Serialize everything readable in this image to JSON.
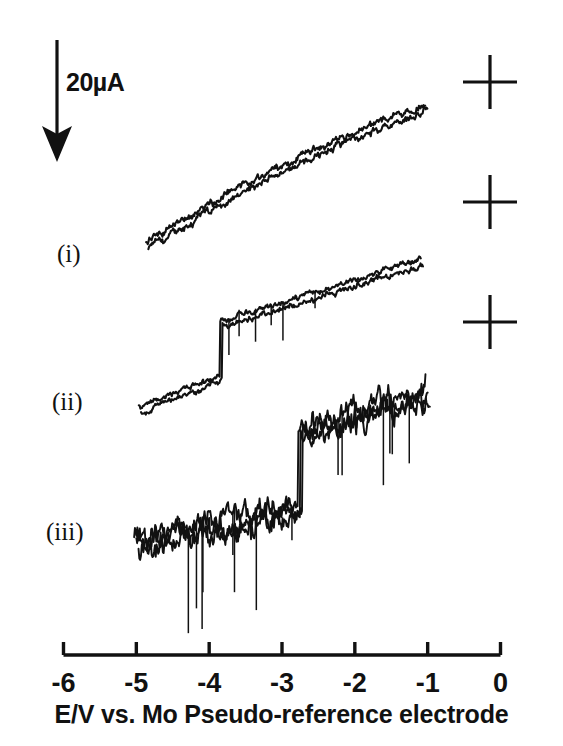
{
  "figure": {
    "background_color": "#ffffff",
    "ink_color": "#111111"
  },
  "scale_bar": {
    "label": "20µA",
    "direction": "down",
    "icon": "down-arrow-icon"
  },
  "trace_labels": {
    "i": "(i)",
    "ii": "(ii)",
    "iii": "(iii)"
  },
  "axis": {
    "title": "E/V vs. Mo Pseudo-reference electrode",
    "tick_labels": [
      "-6",
      "-5",
      "-4",
      "-3",
      "-2",
      "-1",
      "0"
    ],
    "tick_values": [
      -6,
      -5,
      -4,
      -3,
      -2,
      -1,
      0
    ]
  },
  "registration_marks": {
    "name": "crosshair-mark",
    "count": 3,
    "positions": [
      [
        490,
        82
      ],
      [
        490,
        202
      ],
      [
        490,
        322
      ]
    ],
    "arm_length": 27
  },
  "chart_data": {
    "type": "line",
    "title": "",
    "subtitle": "",
    "xlabel": "E/V vs. Mo Pseudo-reference electrode",
    "ylabel": "Current",
    "xlim": [
      -6,
      0
    ],
    "ylim_note": "arbitrary offset per trace; vertical scale bar = 20 microamps, current increases downward",
    "grid": false,
    "legend": "inline-labels",
    "xticks": [
      -6,
      -5,
      -4,
      -3,
      -2,
      -1,
      0
    ],
    "xticklabels": [
      "-6",
      "-5",
      "-4",
      "-3",
      "-2",
      "-1",
      "0"
    ],
    "scale_bar_value": 20,
    "scale_bar_units": "µA",
    "series": [
      {
        "name": "(i)",
        "sweeps": 2,
        "noise_amplitude": 5,
        "spike_count": 0,
        "x_start": -4.85,
        "x_end": -1.02,
        "y_start_px": 245,
        "y_end_px": 107,
        "step": null,
        "description": "noisy monotonic rising trace, two overlapping sweeps, no step"
      },
      {
        "name": "(ii)",
        "sweeps": 2,
        "noise_amplitude": 4,
        "spike_count": 6,
        "x_start": -4.95,
        "x_end": -1.08,
        "y_start_px": 411,
        "y_end_px": 262,
        "step": {
          "x": -3.84,
          "rise_px": 54
        },
        "description": "rising trace with a sharp vertical step near -3.84 V and occasional downward spikes"
      },
      {
        "name": "(iii)",
        "sweeps": 3,
        "noise_amplitude": 16,
        "spike_count": 14,
        "x_start": -5.0,
        "x_end": -1.0,
        "y_start_px": 543,
        "y_end_px": 398,
        "step": {
          "x": -2.75,
          "rise_px": 78
        },
        "description": "very noisy trace with a large step near -2.75 V and many long downward spikes"
      }
    ]
  }
}
